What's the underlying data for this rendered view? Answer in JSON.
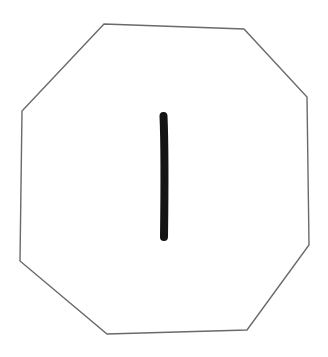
{
  "figure": {
    "background": "#ffffff",
    "shape": {
      "type": "octagon",
      "stroke": "#6a6a6a",
      "stroke_width": 1.4,
      "fill": "#ffffff",
      "points": "104,24 244,29 307,97 309,245 247,330 107,334 20,261 22,111"
    },
    "glyph": {
      "symbol": "I",
      "color": "#141414",
      "stroke_width": 8,
      "path": "M163.5,116 C165,150 164.5,200 164,237"
    }
  }
}
